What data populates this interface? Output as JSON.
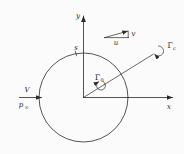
{
  "colors": {
    "background": "#fbfbfb",
    "line": "#2a2a2a",
    "text": "#1e1e1e"
  },
  "axes": {
    "x_label": "x",
    "y_label": "y"
  },
  "freestream": {
    "velocity": "V",
    "pressure": "p",
    "pressure_subscript": "∞"
  },
  "surface": {
    "point_label": "s"
  },
  "velocity_triangle": {
    "horizontal_component": "u",
    "vertical_component": "v"
  },
  "vortex_inner": {
    "symbol": "Γ",
    "subscript": "0"
  },
  "vortex_outer": {
    "symbol": "Γ",
    "subscript": "c"
  }
}
